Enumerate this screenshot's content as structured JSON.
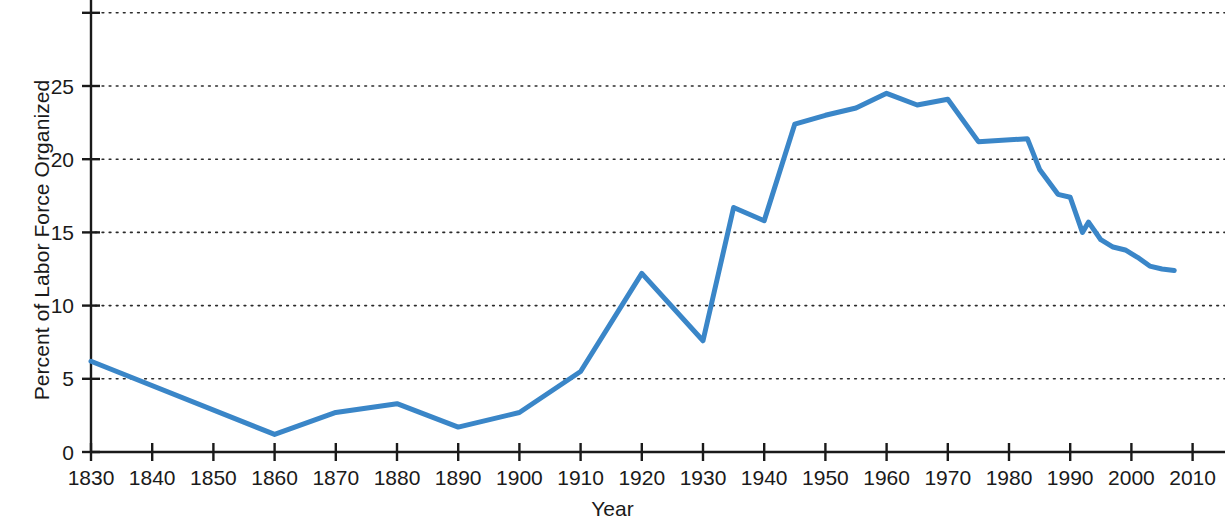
{
  "chart_data": {
    "type": "line",
    "title": "",
    "xlabel": "Year",
    "ylabel": "Percent of Labor Force Organized",
    "xlim": [
      1826,
      2014
    ],
    "ylim": [
      0,
      30
    ],
    "xticks": [
      1830,
      1840,
      1850,
      1860,
      1870,
      1880,
      1890,
      1900,
      1910,
      1920,
      1930,
      1940,
      1950,
      1960,
      1970,
      1980,
      1990,
      2000,
      2010
    ],
    "yticks": [
      0,
      5,
      10,
      15,
      20,
      25,
      30
    ],
    "ytick_labels": [
      "0",
      "5",
      "10",
      "15",
      "20",
      "25",
      ""
    ],
    "grid": "horizontal-dotted",
    "legend": "none",
    "line_color": "#3a86c8",
    "line_width": 5,
    "series": [
      {
        "name": "Percent of Labor Force Organized",
        "x": [
          1830,
          1860,
          1870,
          1880,
          1890,
          1900,
          1910,
          1920,
          1930,
          1935,
          1940,
          1945,
          1950,
          1955,
          1960,
          1965,
          1970,
          1975,
          1983,
          1985,
          1988,
          1990,
          1992,
          1993,
          1995,
          1997,
          1999,
          2001,
          2003,
          2005,
          2007
        ],
        "y": [
          6.2,
          1.2,
          2.7,
          3.3,
          1.7,
          2.7,
          5.5,
          12.2,
          7.6,
          16.7,
          15.8,
          22.4,
          23.0,
          23.5,
          24.5,
          23.7,
          24.1,
          21.2,
          21.4,
          19.3,
          17.6,
          17.4,
          15.0,
          15.7,
          14.5,
          14.0,
          13.8,
          13.3,
          12.7,
          12.5,
          12.4
        ]
      }
    ]
  },
  "axis": {
    "xlabel": "Year",
    "ylabel": "Percent of Labor Force Organized"
  }
}
